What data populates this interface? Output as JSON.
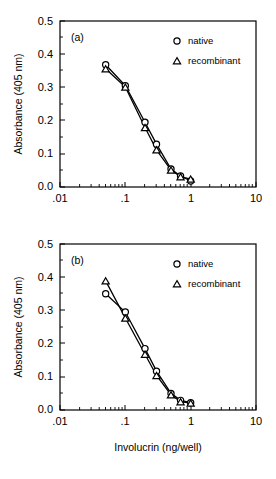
{
  "figure": {
    "xlabel": "Involucrin (ng/well)",
    "ylabel": "Absorbance (405 nm)",
    "xticklabels": [
      ".01",
      ".1",
      "1",
      "10"
    ],
    "yticklabels": [
      "0.0",
      "0.1",
      "0.2",
      "0.3",
      "0.4",
      "0.5"
    ],
    "legend": {
      "native_label": "native",
      "recombinant_label": "recombinant",
      "native_marker": "circle-marker",
      "recombinant_marker": "triangle-marker"
    }
  },
  "chart_data": [
    {
      "type": "line",
      "panel": "(a)",
      "title": "",
      "xlabel": "",
      "ylabel": "Absorbance (405 nm)",
      "xscale": "log",
      "xlim": [
        0.01,
        10
      ],
      "ylim": [
        0.0,
        0.5
      ],
      "xticks": [
        0.01,
        0.1,
        1,
        10
      ],
      "xticklabels": [
        ".01",
        ".1",
        "1",
        "10"
      ],
      "yticks": [
        0.0,
        0.1,
        0.2,
        0.3,
        0.4,
        0.5
      ],
      "yticklabels": [
        "0.0",
        "0.1",
        "0.2",
        "0.3",
        "0.4",
        "0.5"
      ],
      "grid": false,
      "legend_position": "top-right",
      "series": [
        {
          "name": "native",
          "marker": "circle",
          "x": [
            0.05,
            0.1,
            0.2,
            0.3,
            0.5,
            0.7,
            1.0
          ],
          "values": [
            0.368,
            0.305,
            0.195,
            0.129,
            0.054,
            0.033,
            0.018
          ]
        },
        {
          "name": "recombinant",
          "marker": "triangle",
          "x": [
            0.05,
            0.1,
            0.2,
            0.3,
            0.5,
            0.7,
            1.0
          ],
          "values": [
            0.356,
            0.301,
            0.179,
            0.112,
            0.051,
            0.031,
            0.024
          ]
        }
      ]
    },
    {
      "type": "line",
      "panel": "(b)",
      "title": "",
      "xlabel": "Involucrin (ng/well)",
      "ylabel": "Absorbance (405 nm)",
      "xscale": "log",
      "xlim": [
        0.01,
        10
      ],
      "ylim": [
        0.0,
        0.5
      ],
      "xticks": [
        0.01,
        0.1,
        1,
        10
      ],
      "xticklabels": [
        ".01",
        ".1",
        "1",
        "10"
      ],
      "yticks": [
        0.0,
        0.1,
        0.2,
        0.3,
        0.4,
        0.5
      ],
      "yticklabels": [
        "0.0",
        "0.1",
        "0.2",
        "0.3",
        "0.4",
        "0.5"
      ],
      "grid": false,
      "legend_position": "top-right",
      "series": [
        {
          "name": "native",
          "marker": "circle",
          "x": [
            0.05,
            0.1,
            0.2,
            0.3,
            0.5,
            0.7,
            1.0
          ],
          "values": [
            0.35,
            0.295,
            0.185,
            0.117,
            0.05,
            0.029,
            0.022
          ]
        },
        {
          "name": "recombinant",
          "marker": "triangle",
          "x": [
            0.05,
            0.1,
            0.2,
            0.3,
            0.5,
            0.7,
            1.0
          ],
          "values": [
            0.389,
            0.277,
            0.168,
            0.104,
            0.046,
            0.025,
            0.021
          ]
        }
      ]
    }
  ]
}
